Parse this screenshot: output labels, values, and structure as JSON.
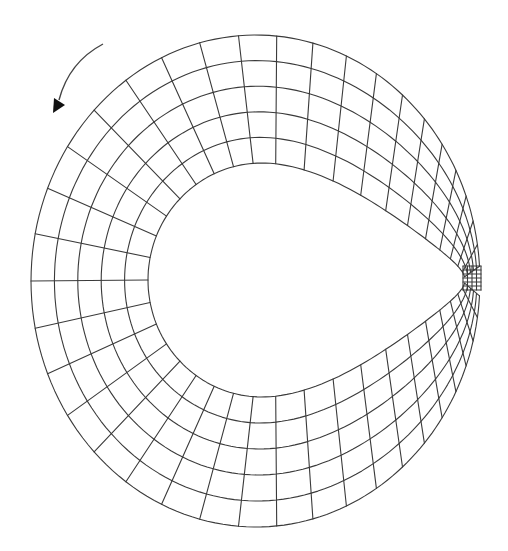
{
  "diagram": {
    "type": "structured-mesh",
    "colors": {
      "line": "#3a3a3a",
      "background": "#ffffff",
      "arrow": "#111111"
    },
    "outer_boundary": {
      "cx": 256,
      "cy": 281,
      "rx": 225,
      "ry": 246
    },
    "inner_boundary": {
      "left_x": 148,
      "top_y": 163,
      "bottom_y": 397,
      "cusp": [
        465,
        278
      ]
    },
    "mesh": {
      "radial_cells": 5,
      "angular_cells": 40
    },
    "cusp_block": {
      "x": 463,
      "y": 266,
      "width": 18,
      "height": 24,
      "cols": 4,
      "rows": 6
    },
    "rotation_arrow": {
      "direction": "counter-clockwise",
      "start": [
        103,
        44
      ],
      "end": [
        55,
        110
      ]
    }
  }
}
